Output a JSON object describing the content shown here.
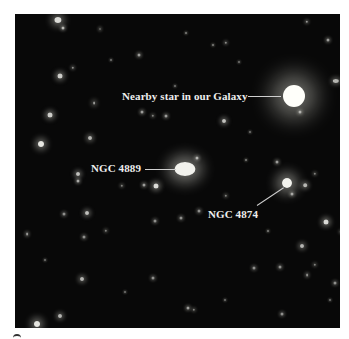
{
  "figure": {
    "background": "#ffffff",
    "photo_background": "#080808",
    "annotations": [
      {
        "id": "nearby-star",
        "text": "Nearby star in our Galaxy",
        "label_x": 122,
        "label_y": 91,
        "line": [
          248,
          96,
          281,
          96
        ],
        "target": [
          294,
          96
        ]
      },
      {
        "id": "ngc-4889",
        "text": "NGC 4889",
        "label_x": 91,
        "label_y": 163,
        "line": [
          145,
          169,
          176,
          169
        ],
        "target": [
          185,
          169
        ]
      },
      {
        "id": "ngc-4874",
        "text": "NGC 4874",
        "label_x": 208,
        "label_y": 209,
        "line": [
          257,
          205,
          284,
          187
        ],
        "target": [
          287,
          183
        ]
      }
    ],
    "objects": [
      {
        "x": 294,
        "y": 96,
        "r": 11,
        "glow": 22,
        "a": 1.0
      },
      {
        "x": 185,
        "y": 169,
        "r": 7,
        "glow": 14,
        "a": 0.95,
        "sx": 1.5
      },
      {
        "x": 287,
        "y": 183,
        "r": 5,
        "glow": 12,
        "a": 0.95
      },
      {
        "x": 58,
        "y": 20,
        "r": 3,
        "glow": 7,
        "a": 0.85,
        "sx": 1.2
      },
      {
        "x": 63,
        "y": 28,
        "r": 1.5,
        "glow": 3,
        "a": 0.7
      },
      {
        "x": 100,
        "y": 29,
        "r": 1,
        "glow": 3,
        "a": 0.6,
        "sx": 0.5
      },
      {
        "x": 139,
        "y": 55,
        "r": 1.5,
        "glow": 3,
        "a": 0.6
      },
      {
        "x": 60,
        "y": 76,
        "r": 2.5,
        "glow": 5,
        "a": 0.8
      },
      {
        "x": 73,
        "y": 68,
        "r": 1.2,
        "glow": 3,
        "a": 0.55
      },
      {
        "x": 94,
        "y": 103,
        "r": 1.5,
        "glow": 4,
        "a": 0.6,
        "sx": 0.6
      },
      {
        "x": 50,
        "y": 115,
        "r": 2.5,
        "glow": 5,
        "a": 0.8
      },
      {
        "x": 41,
        "y": 144,
        "r": 3,
        "glow": 6,
        "a": 0.9
      },
      {
        "x": 90,
        "y": 138,
        "r": 2,
        "glow": 4,
        "a": 0.7
      },
      {
        "x": 142,
        "y": 112,
        "r": 1.5,
        "glow": 3,
        "a": 0.6
      },
      {
        "x": 153,
        "y": 116,
        "r": 1.2,
        "glow": 3,
        "a": 0.5
      },
      {
        "x": 166,
        "y": 116,
        "r": 1.5,
        "glow": 3,
        "a": 0.6
      },
      {
        "x": 336,
        "y": 81,
        "r": 2,
        "glow": 4,
        "a": 0.7,
        "sx": 1.6
      },
      {
        "x": 224,
        "y": 121,
        "r": 2,
        "glow": 4,
        "a": 0.75
      },
      {
        "x": 307,
        "y": 22,
        "r": 1.2,
        "glow": 3,
        "a": 0.6
      },
      {
        "x": 328,
        "y": 40,
        "r": 1.5,
        "glow": 3,
        "a": 0.6
      },
      {
        "x": 226,
        "y": 43,
        "r": 1.2,
        "glow": 3,
        "a": 0.55
      },
      {
        "x": 213,
        "y": 45,
        "r": 1,
        "glow": 2,
        "a": 0.5
      },
      {
        "x": 300,
        "y": 112,
        "r": 1.5,
        "glow": 3,
        "a": 0.6
      },
      {
        "x": 197,
        "y": 158,
        "r": 1.5,
        "glow": 3,
        "a": 0.65
      },
      {
        "x": 277,
        "y": 162,
        "r": 1.5,
        "glow": 3,
        "a": 0.6
      },
      {
        "x": 186,
        "y": 33,
        "r": 1,
        "glow": 2,
        "a": 0.5
      },
      {
        "x": 78,
        "y": 174,
        "r": 2,
        "glow": 4,
        "a": 0.75
      },
      {
        "x": 78,
        "y": 181,
        "r": 1.5,
        "glow": 3,
        "a": 0.65
      },
      {
        "x": 156,
        "y": 186,
        "r": 2.5,
        "glow": 5,
        "a": 0.85
      },
      {
        "x": 144,
        "y": 185,
        "r": 1.5,
        "glow": 3,
        "a": 0.6
      },
      {
        "x": 122,
        "y": 186,
        "r": 1.2,
        "glow": 3,
        "a": 0.5
      },
      {
        "x": 87,
        "y": 213,
        "r": 2,
        "glow": 4,
        "a": 0.75
      },
      {
        "x": 64,
        "y": 214,
        "r": 1.5,
        "glow": 3,
        "a": 0.55
      },
      {
        "x": 27,
        "y": 234,
        "r": 1.5,
        "glow": 3,
        "a": 0.6,
        "sx": 0.6
      },
      {
        "x": 82,
        "y": 279,
        "r": 2,
        "glow": 4,
        "a": 0.7
      },
      {
        "x": 60,
        "y": 316,
        "r": 2,
        "glow": 4,
        "a": 0.7
      },
      {
        "x": 37,
        "y": 324,
        "r": 3,
        "glow": 7,
        "a": 0.9
      },
      {
        "x": 153,
        "y": 278,
        "r": 1.5,
        "glow": 3,
        "a": 0.55
      },
      {
        "x": 106,
        "y": 231,
        "r": 1.2,
        "glow": 3,
        "a": 0.5
      },
      {
        "x": 84,
        "y": 237,
        "r": 1.5,
        "glow": 3,
        "a": 0.55
      },
      {
        "x": 181,
        "y": 218,
        "r": 1.5,
        "glow": 3,
        "a": 0.55
      },
      {
        "x": 199,
        "y": 211,
        "r": 1.5,
        "glow": 3,
        "a": 0.55
      },
      {
        "x": 305,
        "y": 185,
        "r": 1.8,
        "glow": 4,
        "a": 0.7
      },
      {
        "x": 292,
        "y": 194,
        "r": 1.5,
        "glow": 3,
        "a": 0.6
      },
      {
        "x": 326,
        "y": 222,
        "r": 2.5,
        "glow": 5,
        "a": 0.85
      },
      {
        "x": 341,
        "y": 232,
        "r": 1.2,
        "glow": 3,
        "a": 0.5
      },
      {
        "x": 302,
        "y": 246,
        "r": 2,
        "glow": 4,
        "a": 0.7
      },
      {
        "x": 280,
        "y": 267,
        "r": 1.5,
        "glow": 3,
        "a": 0.55
      },
      {
        "x": 307,
        "y": 275,
        "r": 1.5,
        "glow": 3,
        "a": 0.55,
        "sx": 0.6
      },
      {
        "x": 254,
        "y": 268,
        "r": 1.5,
        "glow": 3,
        "a": 0.55
      },
      {
        "x": 188,
        "y": 308,
        "r": 1.5,
        "glow": 3,
        "a": 0.6
      },
      {
        "x": 194,
        "y": 310,
        "r": 1.2,
        "glow": 3,
        "a": 0.5
      },
      {
        "x": 315,
        "y": 265,
        "r": 1.2,
        "glow": 3,
        "a": 0.5
      },
      {
        "x": 335,
        "y": 283,
        "r": 1.5,
        "glow": 3,
        "a": 0.55
      },
      {
        "x": 155,
        "y": 221,
        "r": 1.5,
        "glow": 3,
        "a": 0.55
      },
      {
        "x": 226,
        "y": 196,
        "r": 1.2,
        "glow": 3,
        "a": 0.5
      },
      {
        "x": 246,
        "y": 160,
        "r": 1,
        "glow": 2,
        "a": 0.5
      },
      {
        "x": 315,
        "y": 174,
        "r": 1.2,
        "glow": 3,
        "a": 0.5
      },
      {
        "x": 268,
        "y": 231,
        "r": 1,
        "glow": 2,
        "a": 0.5
      },
      {
        "x": 111,
        "y": 60,
        "r": 1,
        "glow": 2,
        "a": 0.45
      },
      {
        "x": 239,
        "y": 62,
        "r": 1,
        "glow": 2,
        "a": 0.45
      },
      {
        "x": 125,
        "y": 292,
        "r": 1,
        "glow": 2,
        "a": 0.45
      },
      {
        "x": 225,
        "y": 300,
        "r": 1,
        "glow": 2,
        "a": 0.45
      },
      {
        "x": 282,
        "y": 314,
        "r": 1.5,
        "glow": 3,
        "a": 0.55
      },
      {
        "x": 330,
        "y": 300,
        "r": 1,
        "glow": 2,
        "a": 0.45
      },
      {
        "x": 45,
        "y": 260,
        "r": 1,
        "glow": 2,
        "a": 0.45
      },
      {
        "x": 250,
        "y": 132,
        "r": 1,
        "glow": 2,
        "a": 0.45
      },
      {
        "x": 175,
        "y": 86,
        "r": 1,
        "glow": 2,
        "a": 0.45
      }
    ]
  }
}
